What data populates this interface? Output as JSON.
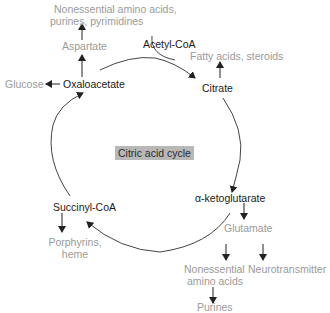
{
  "diagram": {
    "title": "Citric acid cycle",
    "intermediates": [
      {
        "id": "acetyl_coa",
        "label": "Acetyl-CoA"
      },
      {
        "id": "citrate",
        "label": "Citrate"
      },
      {
        "id": "alpha_ketoglutarate",
        "label": "α-ketoglutarate"
      },
      {
        "id": "succinyl_coa",
        "label": "Succinyl-CoA"
      },
      {
        "id": "oxaloacetate",
        "label": "Oxaloacetate"
      }
    ],
    "products": {
      "nonessential_top_line1": "Nonessential amino acids,",
      "nonessential_top_line2": "purines, pyrimidines",
      "aspartate": "Aspartate",
      "glucose": "Glucose",
      "fatty_acids": "Fatty acids, steroids",
      "porphyrins_line1": "Porphyrins,",
      "porphyrins_line2": "heme",
      "glutamate": "Glutamate",
      "nonessential_bottom_line1": "Nonessential",
      "nonessential_bottom_line2": "amino acids",
      "neurotransmitter": "Neurotransmitter",
      "purines": "Purines"
    },
    "colors": {
      "intermediate_text": "#1a1a1a",
      "product_text": "#9a9a9a",
      "arrow": "#333333",
      "title_bg": "#b8b8b8"
    }
  }
}
